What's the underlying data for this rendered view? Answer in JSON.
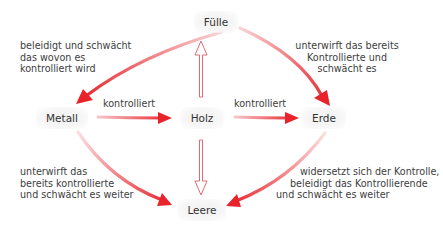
{
  "diagram": {
    "type": "five-phase control diagram",
    "colors": {
      "arrow": "#e8232b",
      "arrow_fade": "#f6c3c6",
      "node_bg": "#f1f1f1",
      "text": "#3a3a3a"
    },
    "nodes": {
      "fuelle": "Fülle",
      "metall": "Metall",
      "holz": "Holz",
      "erde": "Erde",
      "leere": "Leere"
    },
    "edges": {
      "fuelle_metall": [
        "beleidigt und schwächt",
        "das wovon es",
        "kontrolliert wird"
      ],
      "fuelle_erde": [
        "unterwirft das bereits",
        "Kontrollierte und",
        "schwächt es"
      ],
      "metall_holz": "kontrolliert",
      "holz_erde": "kontrolliert",
      "metall_leere": [
        "unterwirft das",
        "bereits kontrollierte",
        "und schwächt es weiter"
      ],
      "erde_leere": [
        "widersetzt sich der Kontrolle,",
        "beleidigt das Kontrollierende",
        "und schwächt es weiter"
      ]
    },
    "arrows": [
      {
        "from": "Fülle",
        "to": "Metall",
        "style": "solid-gradient"
      },
      {
        "from": "Fülle",
        "to": "Erde",
        "style": "solid-gradient"
      },
      {
        "from": "Metall",
        "to": "Holz",
        "style": "solid-gradient"
      },
      {
        "from": "Holz",
        "to": "Erde",
        "style": "solid-gradient"
      },
      {
        "from": "Metall",
        "to": "Leere",
        "style": "solid-gradient"
      },
      {
        "from": "Erde",
        "to": "Leere",
        "style": "solid-gradient"
      },
      {
        "from": "Holz",
        "to": "Fülle",
        "style": "outline"
      },
      {
        "from": "Holz",
        "to": "Leere",
        "style": "outline"
      }
    ]
  }
}
